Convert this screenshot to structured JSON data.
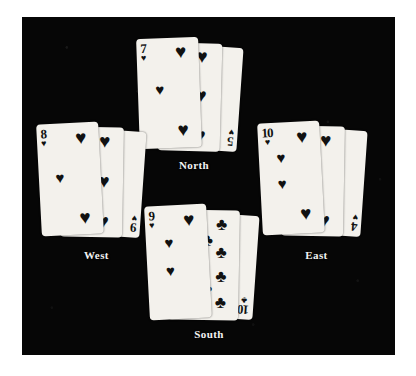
{
  "figure": {
    "background_color": "#060606",
    "page_color": "#ffffff",
    "card_face_color": "#f3f1ec",
    "ink_color": "#111111",
    "label_color": "#f2f2f2"
  },
  "suits": {
    "heart": "♥",
    "club": "♣"
  },
  "hands": [
    {
      "position": "north",
      "label": "North",
      "cards": [
        {
          "rank": "7",
          "suit": "heart",
          "suit_name": "hearts",
          "layer": 1
        },
        {
          "rank": "5",
          "suit": "heart",
          "suit_name": "hearts",
          "layer": 2
        },
        {
          "rank": "5",
          "suit": "heart",
          "suit_name": "hearts",
          "layer": 3,
          "bottom_index_only": true
        }
      ]
    },
    {
      "position": "west",
      "label": "West",
      "cards": [
        {
          "rank": "8",
          "suit": "heart",
          "suit_name": "hearts",
          "layer": 1
        },
        {
          "rank": "6",
          "suit": "heart",
          "suit_name": "hearts",
          "layer": 2
        },
        {
          "rank": "9",
          "suit": "heart",
          "suit_name": "hearts",
          "layer": 3,
          "bottom_index_only": true
        }
      ]
    },
    {
      "position": "east",
      "label": "East",
      "cards": [
        {
          "rank": "10",
          "suit": "heart",
          "suit_name": "hearts",
          "layer": 1
        },
        {
          "rank": "4",
          "suit": "heart",
          "suit_name": "hearts",
          "layer": 2
        },
        {
          "rank": "4",
          "suit": "heart",
          "suit_name": "hearts",
          "layer": 3,
          "bottom_index_only": true
        }
      ]
    },
    {
      "position": "south",
      "label": "South",
      "cards": [
        {
          "rank": "9",
          "suit": "heart",
          "suit_name": "hearts",
          "layer": 1
        },
        {
          "rank": "10",
          "suit": "club",
          "suit_name": "clubs",
          "layer": 2
        },
        {
          "rank": "10",
          "suit": "club",
          "suit_name": "clubs",
          "layer": 3,
          "bottom_index_only": true
        }
      ]
    }
  ],
  "labels": {
    "north": "North",
    "south": "South",
    "east": "East",
    "west": "West"
  }
}
